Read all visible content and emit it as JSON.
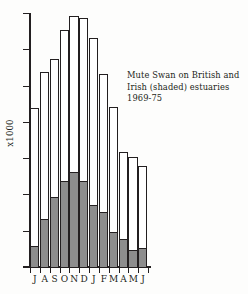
{
  "chart_data": {
    "type": "bar",
    "title": "",
    "annotation_lines": [
      "Mute Swan on British and",
      "Irish (shaded) estuaries",
      "1969-75"
    ],
    "xlabel": "",
    "ylabel": "x1000",
    "ylim": [
      0,
      7
    ],
    "ytick_labels": [
      "7",
      "6",
      "5",
      "4",
      "3",
      "2",
      "1",
      "0"
    ],
    "ytick_values": [
      7,
      6,
      5,
      4,
      3,
      2,
      1,
      0
    ],
    "grid": false,
    "legend": "shaded = Irish estuaries",
    "categories": [
      "J",
      "A",
      "S",
      "O",
      "N",
      "D",
      "J",
      "F",
      "M",
      "A",
      "M",
      "J"
    ],
    "category_full": [
      "July",
      "August",
      "September",
      "October",
      "November",
      "December",
      "January",
      "February",
      "March",
      "April",
      "May",
      "June"
    ],
    "series": [
      {
        "name": "British and Irish (total)",
        "fill": "#ffffff",
        "values": [
          4.4,
          5.4,
          5.75,
          6.55,
          6.95,
          6.9,
          6.35,
          5.35,
          4.45,
          3.2,
          3.05,
          2.8
        ]
      },
      {
        "name": "Irish (shaded)",
        "fill": "#8d8d8d",
        "values": [
          0.6,
          1.35,
          1.95,
          2.4,
          2.65,
          2.4,
          1.75,
          1.55,
          1.0,
          0.8,
          0.5,
          0.55
        ]
      }
    ],
    "units": "thousands of birds",
    "stacked": true
  },
  "colors": {
    "ink": "#231f20",
    "shaded_fill": "#8d8d8d",
    "open_fill": "#ffffff",
    "background": "#fdfdfc"
  }
}
